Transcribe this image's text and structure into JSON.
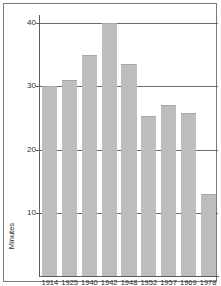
{
  "chart_data": {
    "type": "bar",
    "title": "",
    "xlabel": "",
    "ylabel": "Minutes",
    "categories": [
      "1914",
      "1925",
      "1940",
      "1942",
      "1948",
      "1952",
      "1957",
      "1969",
      "1978"
    ],
    "values": [
      30,
      31,
      35,
      40,
      33.5,
      25.3,
      27,
      25.7,
      13
    ],
    "ylim": [
      0,
      41
    ],
    "yticks": [
      10,
      20,
      30,
      40
    ],
    "ytick_labels": [
      "10",
      "20",
      "30",
      "40"
    ],
    "grid": true,
    "legend": "none",
    "bar_color": "#bdbdbd",
    "axis_color": "#5e5e5e",
    "gridline_color": "#6b6b6b",
    "frame_color": "#7a7a7a",
    "background_color": "#ffffff",
    "text_color": "#2b2b2b"
  }
}
